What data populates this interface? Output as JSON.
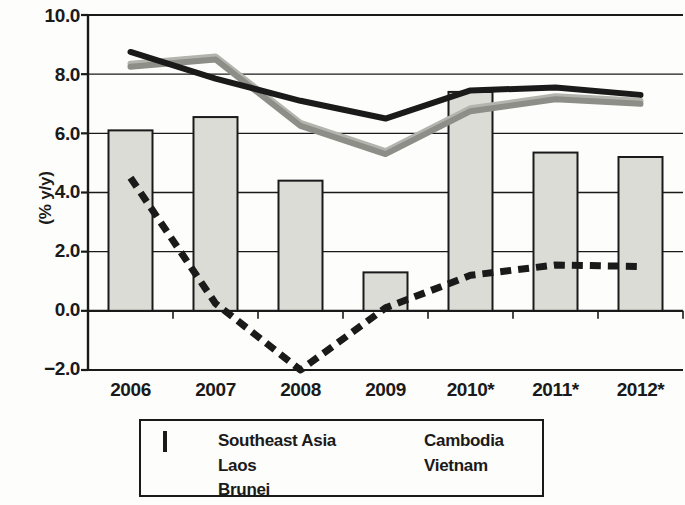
{
  "chart_data": {
    "type": "bar",
    "title": "",
    "xlabel": "",
    "ylabel": "(% y/y)",
    "categories": [
      "2006",
      "2007",
      "2008",
      "2009",
      "2010*",
      "2011*",
      "2012*"
    ],
    "ylim": [
      -2.0,
      10.0
    ],
    "yticks": [
      "10.0",
      "8.0",
      "6.0",
      "4.0",
      "2.0",
      "0.0",
      "−2.0"
    ],
    "ytick_values": [
      10.0,
      8.0,
      6.0,
      4.0,
      2.0,
      0.0,
      -2.0
    ],
    "grid": true,
    "legend_position": "bottom",
    "bar_series": {
      "name": "Southeast Asia",
      "values": [
        6.1,
        6.55,
        4.4,
        1.3,
        7.4,
        5.35,
        5.2
      ],
      "fill": "#dcdcd6",
      "stroke": "#1a1a1a"
    },
    "series": [
      {
        "name": "Laos",
        "type": "line",
        "style": "solid",
        "color": "#1a1a1a",
        "values": [
          8.75,
          7.85,
          7.1,
          6.5,
          7.45,
          7.55,
          7.3
        ]
      },
      {
        "name": "Cambodia",
        "type": "line",
        "style": "solid",
        "color": "#b4b4ae",
        "values": [
          8.3,
          8.55,
          6.3,
          5.35,
          6.8,
          7.2,
          7.05
        ]
      },
      {
        "name": "Vietnam",
        "type": "line",
        "style": "solid",
        "color": "#8e8e88",
        "values": [
          8.3,
          8.55,
          6.3,
          5.35,
          6.8,
          7.2,
          7.05
        ]
      },
      {
        "name": "Brunei",
        "type": "line",
        "style": "dashed",
        "color": "#1a1a1a",
        "values": [
          4.5,
          0.25,
          -2.0,
          0.1,
          1.2,
          1.55,
          1.5
        ]
      }
    ],
    "legend": [
      {
        "label": "Southeast Asia",
        "marker": "bar-swatch"
      },
      {
        "label": "Cambodia",
        "marker": "light-gray-line"
      },
      {
        "label": "Laos",
        "marker": "black-solid-line"
      },
      {
        "label": "Vietnam",
        "marker": "medium-gray-line"
      },
      {
        "label": "Brunei",
        "marker": "black-dashed-line"
      }
    ]
  }
}
